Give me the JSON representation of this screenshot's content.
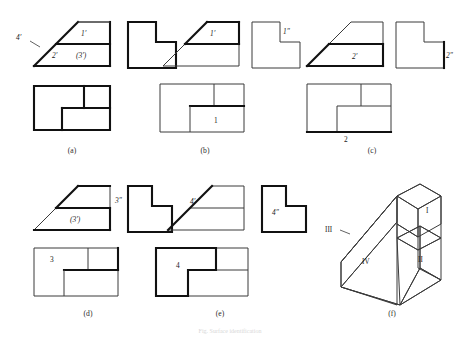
{
  "figure": {
    "caption": "Fig.  Surface identification",
    "panels": [
      {
        "id": "a",
        "label": "(a)",
        "marks": [
          {
            "text": "1′",
            "kind": "surface-label"
          },
          {
            "text": "4′",
            "kind": "surface-label"
          },
          {
            "text": "2′",
            "kind": "surface-label"
          },
          {
            "text": "(3′)",
            "kind": "surface-label-hidden"
          }
        ]
      },
      {
        "id": "b",
        "label": "(b)",
        "marks": [
          {
            "text": "1′",
            "kind": "surface-label"
          },
          {
            "text": "1″",
            "kind": "surface-label"
          },
          {
            "text": "1",
            "kind": "surface-label"
          }
        ]
      },
      {
        "id": "c",
        "label": "(c)",
        "marks": [
          {
            "text": "2′",
            "kind": "surface-label"
          },
          {
            "text": "2″",
            "kind": "surface-label"
          },
          {
            "text": "2",
            "kind": "surface-label"
          }
        ]
      },
      {
        "id": "d",
        "label": "(d)",
        "marks": [
          {
            "text": "(3′)",
            "kind": "surface-label-hidden"
          },
          {
            "text": "3″",
            "kind": "surface-label"
          },
          {
            "text": "3",
            "kind": "surface-label"
          }
        ]
      },
      {
        "id": "e",
        "label": "(e)",
        "marks": [
          {
            "text": "4′",
            "kind": "surface-label"
          },
          {
            "text": "4″",
            "kind": "surface-label"
          },
          {
            "text": "4",
            "kind": "surface-label"
          }
        ]
      },
      {
        "id": "f",
        "label": "(f)",
        "marks": [
          {
            "text": "I",
            "kind": "roman-label"
          },
          {
            "text": "II",
            "kind": "roman-label"
          },
          {
            "text": "III",
            "kind": "roman-label"
          },
          {
            "text": "IV",
            "kind": "roman-label"
          }
        ]
      }
    ],
    "labels": {
      "a_1p": "1′",
      "a_4p": "4′",
      "a_2p": "2′",
      "a_3p": "(3′)",
      "b_1p": "1′",
      "b_1pp": "1″",
      "b_1": "1",
      "c_2p": "2′",
      "c_2pp": "2″",
      "c_2": "2",
      "d_3p": "(3′)",
      "d_3pp": "3″",
      "d_3": "3",
      "e_4p": "4′",
      "e_4pp": "4″",
      "e_4": "4",
      "f_I": "I",
      "f_II": "II",
      "f_III": "III",
      "f_IV": "IV",
      "panel_a": "(a)",
      "panel_b": "(b)",
      "panel_c": "(c)",
      "panel_d": "(d)",
      "panel_e": "(e)",
      "panel_f": "(f)"
    }
  },
  "colors": {
    "thin_line": "#3a3a3a",
    "bold_line": "#111111",
    "background": "#ffffff",
    "text": "#1a1a1a"
  }
}
